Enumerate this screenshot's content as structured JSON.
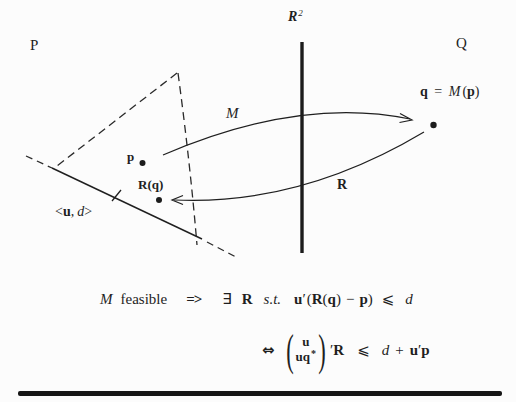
{
  "colors": {
    "ink": "#1f1f1f",
    "bg": "#fcfcfc"
  },
  "diagram": {
    "region_left": "P",
    "region_right": "Q",
    "axis_r": "R",
    "axis_r_sup": "2",
    "map_m_label": "M",
    "map_r_label": "R",
    "point_p_label": "p",
    "point_rq_label": "R(q)",
    "point_q": {
      "q": "q",
      "eq": "=",
      "m": "M",
      "lp": "(",
      "p": "p",
      "rp": ")"
    },
    "halfspace": {
      "lt": "<",
      "u": "u",
      "comma": ",",
      "d": "d",
      "gt": ">"
    }
  },
  "formula1": {
    "m": "M",
    "feasible": "feasible",
    "implies": "=>",
    "exists": "∃",
    "r": "R",
    "st": "s.t.",
    "u": "u",
    "prime": "′",
    "lp": "(",
    "r2": "R",
    "lp2": "(",
    "q": "q",
    "rp2": ")",
    "minus": "−",
    "p": "p",
    "rp": ")",
    "leq": "⩽",
    "d": "d"
  },
  "formula2": {
    "iff": "⇔",
    "lparen": "(",
    "row1_u": "u",
    "row2_u": "u",
    "row2_q": "q",
    "row2_sup": "*",
    "rparen": ")",
    "prime": "′",
    "r": "R",
    "leq": "⩽",
    "d": "d",
    "plus": "+",
    "u2": "u",
    "prime2": "′",
    "p": "p"
  }
}
